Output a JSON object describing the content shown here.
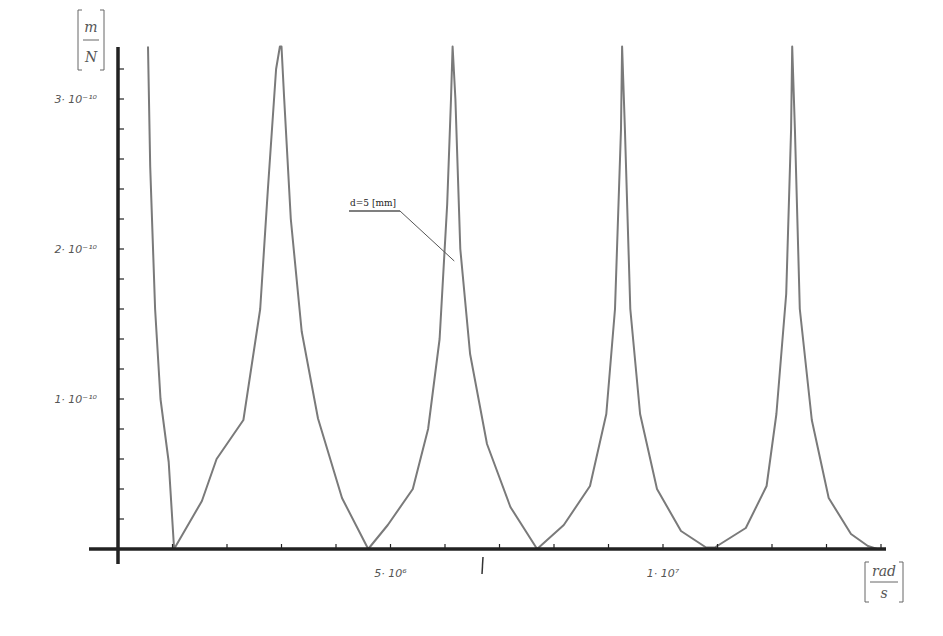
{
  "chart_data": {
    "type": "line",
    "title": "",
    "xlabel": "",
    "ylabel": "",
    "x_unit": {
      "numerator": "rad",
      "denominator": "s"
    },
    "y_unit": {
      "numerator": "m",
      "denominator": "N"
    },
    "xlim": [
      0,
      14100000
    ],
    "ylim": [
      0,
      3.35e-10
    ],
    "x_major_ticks": [
      {
        "value": 5000000,
        "label": "5· 10⁶"
      },
      {
        "value": 10000000,
        "label": "1· 10⁷"
      }
    ],
    "x_minor_step": 1000000,
    "y_major_ticks": [
      {
        "value": 1e-10,
        "label": "1· 10⁻¹⁰"
      },
      {
        "value": 2e-10,
        "label": "2· 10⁻¹⁰"
      },
      {
        "value": 3e-10,
        "label": "3· 10⁻¹⁰"
      }
    ],
    "y_minor_step": 2e-11,
    "grid": false,
    "legend": "none",
    "annotation": {
      "text": "d=5 [mm]",
      "points_to": {
        "x": 6170000,
        "y": 1.92e-10
      }
    },
    "series": [
      {
        "name": "d=5 [mm]",
        "color": "#7a7a7a",
        "x": [
          550000,
          590000,
          680000,
          780000,
          930000,
          1030000,
          1540000,
          1810000,
          2300000,
          2610000,
          2750000,
          2900000,
          2970000,
          3000000,
          3000000,
          3050000,
          3170000,
          3370000,
          3670000,
          4110000,
          4590000,
          4590000,
          4950000,
          5410000,
          5690000,
          5900000,
          6040000,
          6110000,
          6140000,
          6140000,
          6190000,
          6280000,
          6460000,
          6770000,
          7200000,
          7690000,
          7690000,
          8180000,
          8660000,
          8960000,
          9120000,
          9230000,
          9250000,
          9250000,
          9300000,
          9400000,
          9580000,
          9890000,
          10330000,
          10790000,
          10950000,
          11520000,
          11900000,
          12080000,
          12260000,
          12350000,
          12370000,
          12370000,
          12420000,
          12510000,
          12730000,
          13040000,
          13450000,
          13760000,
          13930000
        ],
        "y": [
          3.35e-10,
          2.55e-10,
          1.6e-10,
          1e-10,
          5.8e-11,
          0,
          3.2e-11,
          6e-11,
          8.6e-11,
          1.6e-10,
          2.4e-10,
          3.2e-10,
          3.35e-10,
          3.35e-10,
          3.35e-10,
          3e-10,
          2.2e-10,
          1.45e-10,
          8.7e-11,
          3.4e-11,
          0,
          0,
          1.6e-11,
          4e-11,
          8e-11,
          1.4e-10,
          2.3e-10,
          3e-10,
          3.35e-10,
          3.35e-10,
          3e-10,
          2e-10,
          1.3e-10,
          7e-11,
          2.8e-11,
          0,
          0,
          1.6e-11,
          4.2e-11,
          9e-11,
          1.6e-10,
          2.8e-10,
          3.35e-10,
          3.35e-10,
          2.8e-10,
          1.6e-10,
          9e-11,
          4e-11,
          1.2e-11,
          1e-12,
          1e-12,
          1.4e-11,
          4.2e-11,
          9e-11,
          1.7e-10,
          2.8e-10,
          3.35e-10,
          3.35e-10,
          2.8e-10,
          1.6e-10,
          8.6e-11,
          3.4e-11,
          1e-11,
          2e-12,
          0
        ]
      }
    ]
  }
}
